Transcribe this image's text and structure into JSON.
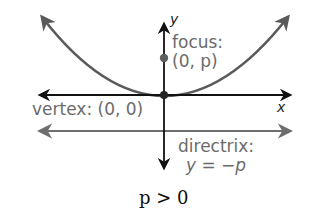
{
  "diagram": {
    "axes": {
      "x_label": "x",
      "y_label": "y"
    },
    "labels": {
      "focus_line1": "focus:",
      "focus_line2": "(0, p)",
      "vertex": "vertex: (0, 0)",
      "directrix_line1": "directrix:",
      "directrix_line2": "y = −p"
    },
    "caption": "p > 0",
    "colors": {
      "axes": "#111111",
      "parabola": "#5a5a5a",
      "directrix": "#6e6e6e",
      "label_text": "#6b6b6b",
      "focus_point": "#5e5e5e",
      "vertex_point": "#222222"
    },
    "points": {
      "vertex": {
        "x": 0,
        "y": 0
      },
      "focus": {
        "x": 0,
        "y": "p"
      }
    }
  }
}
